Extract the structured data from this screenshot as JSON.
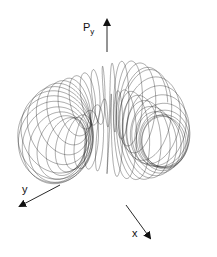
{
  "figure": {
    "background": "#ffffff",
    "line_color": "#222222",
    "axes": [
      {
        "name": "Py",
        "label_main": "P",
        "label_sub": "y",
        "from": [
          107,
          150
        ],
        "to": [
          107,
          20
        ],
        "label_pos": [
          83,
          24
        ]
      },
      {
        "name": "y",
        "label_main": "y",
        "from": [
          107,
          150
        ],
        "to": [
          20,
          206
        ],
        "label_pos": [
          22,
          184
        ]
      },
      {
        "name": "x",
        "label_main": "x",
        "from": [
          107,
          150
        ],
        "to": [
          150,
          238
        ],
        "label_pos": [
          132,
          228
        ]
      }
    ]
  },
  "chart_data": {
    "type": "line",
    "title": "",
    "xlabel": "x",
    "ylabel": "y",
    "zlabel": "Py",
    "surface": "torus-like trajectory (quasi-periodic orbit)",
    "grid": false,
    "legend": "none"
  }
}
